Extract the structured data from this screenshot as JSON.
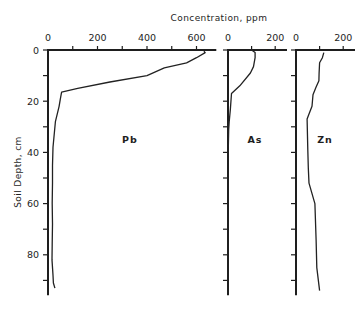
{
  "chart_data": {
    "type": "line",
    "title": "",
    "xlabel": "Concentration, ppm",
    "ylabel": "Soil Depth, cm",
    "y_axis": {
      "range": [
        0,
        95
      ],
      "inverted": true,
      "ticks": [
        0,
        20,
        40,
        60,
        80
      ],
      "minor_ticks": [
        10,
        30,
        50,
        70,
        90
      ]
    },
    "grid": false,
    "panels": [
      {
        "name": "Pb",
        "xlim": [
          0,
          680
        ],
        "x_ticks": [
          0,
          200,
          400,
          600
        ],
        "x_minor_ticks": [
          100,
          300,
          500
        ],
        "points": [
          [
            630,
            0.5
          ],
          [
            635,
            1
          ],
          [
            600,
            3
          ],
          [
            560,
            5
          ],
          [
            470,
            7
          ],
          [
            400,
            10
          ],
          [
            250,
            12.5
          ],
          [
            120,
            15
          ],
          [
            55,
            16.5
          ],
          [
            50,
            19
          ],
          [
            45,
            22
          ],
          [
            30,
            28
          ],
          [
            25,
            33
          ],
          [
            20,
            38
          ],
          [
            18,
            45
          ],
          [
            18,
            52
          ],
          [
            17,
            60
          ],
          [
            18,
            68
          ],
          [
            17,
            76
          ],
          [
            16,
            82
          ],
          [
            20,
            88
          ],
          [
            22,
            91
          ],
          [
            28,
            93
          ]
        ]
      },
      {
        "name": "As",
        "xlim": [
          0,
          250
        ],
        "x_ticks": [
          0,
          200
        ],
        "x_minor_ticks": [
          100
        ],
        "points": [
          [
            100,
            0
          ],
          [
            115,
            1
          ],
          [
            115,
            3
          ],
          [
            108,
            6.5
          ],
          [
            95,
            9
          ],
          [
            50,
            14
          ],
          [
            15,
            17
          ],
          [
            10,
            23
          ],
          [
            5,
            28
          ],
          [
            3,
            31
          ],
          [
            1,
            40
          ],
          [
            0,
            50
          ],
          [
            0,
            70
          ],
          [
            0,
            95
          ]
        ]
      },
      {
        "name": "Zn",
        "xlim": [
          0,
          250
        ],
        "x_ticks": [
          0,
          200
        ],
        "x_minor_ticks": [
          100
        ],
        "points": [
          [
            118,
            1
          ],
          [
            112,
            3
          ],
          [
            100,
            5
          ],
          [
            98,
            9
          ],
          [
            97,
            12
          ],
          [
            85,
            14.5
          ],
          [
            72,
            17.5
          ],
          [
            68,
            22
          ],
          [
            55,
            25
          ],
          [
            47,
            27
          ],
          [
            50,
            39
          ],
          [
            52,
            46
          ],
          [
            55,
            52
          ],
          [
            80,
            60
          ],
          [
            85,
            74
          ],
          [
            88,
            85
          ],
          [
            100,
            94
          ]
        ]
      }
    ],
    "tick_labels": {
      "y": [
        "0",
        "20",
        "40",
        "60",
        "80"
      ],
      "pb": [
        "0",
        "200",
        "400",
        "600"
      ],
      "as": [
        "0",
        "200"
      ],
      "zn": [
        "0",
        "200"
      ]
    }
  }
}
